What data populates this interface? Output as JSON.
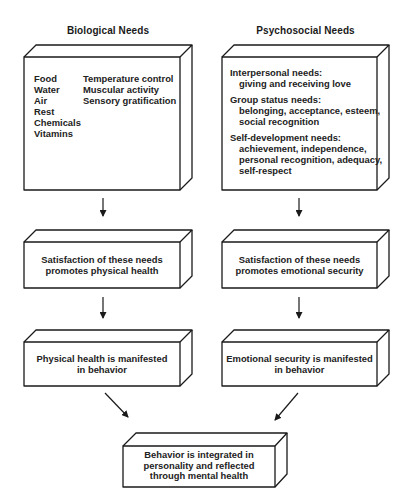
{
  "columns": {
    "biological": {
      "heading": "Biological Needs",
      "needs_left": [
        "Food",
        "Water",
        "Air",
        "Rest",
        "Chemicals",
        "Vitamins"
      ],
      "needs_right": [
        "Temperature control",
        "Muscular activity",
        "Sensory gratification"
      ],
      "satisfaction": [
        "Satisfaction of these needs",
        "promotes physical health"
      ],
      "manifestation": [
        "Physical health is manifested",
        "in behavior"
      ]
    },
    "psychosocial": {
      "heading": "Psychosocial Needs",
      "groups": [
        {
          "title": "Interpersonal needs:",
          "items": [
            "giving and receiving love"
          ]
        },
        {
          "title": "Group status needs:",
          "items": [
            "belonging, acceptance, esteem,",
            "social recognition"
          ]
        },
        {
          "title": "Self-development needs:",
          "items": [
            "achievement, independence,",
            "personal recognition, adequacy,",
            "self-respect"
          ]
        }
      ],
      "satisfaction": [
        "Satisfaction of these needs",
        "promotes emotional security"
      ],
      "manifestation": [
        "Emotional security is manifested",
        "in behavior"
      ]
    }
  },
  "outcome": [
    "Behavior is integrated in",
    "personality and reflected",
    "through mental health"
  ],
  "colors": {
    "line": "#1a1a1a",
    "background": "#ffffff"
  }
}
